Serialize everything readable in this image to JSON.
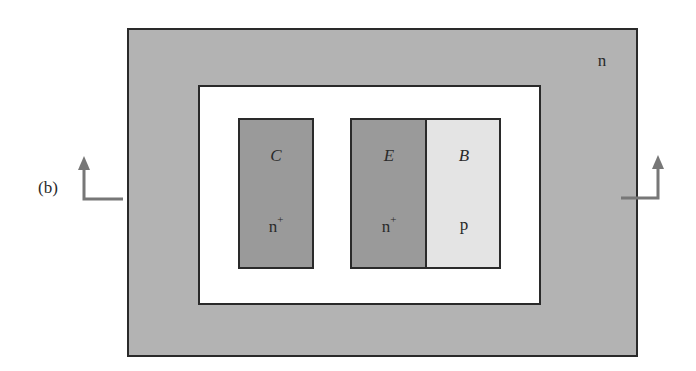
{
  "figure": {
    "panel_label": "(b)",
    "substrate": {
      "label": "n",
      "color": "#b3b3b3"
    },
    "well": {
      "color": "#ffffff"
    },
    "regions": [
      {
        "id": "collector",
        "terminal": "C",
        "doping": "n",
        "doping_sup": "+",
        "color": "#9a9a9a"
      },
      {
        "id": "emitter",
        "terminal": "E",
        "doping": "n",
        "doping_sup": "+",
        "color": "#9a9a9a"
      },
      {
        "id": "base",
        "terminal": "B",
        "doping": "p",
        "doping_sup": "",
        "color": "#e4e4e4"
      }
    ],
    "section_arrows": {
      "color": "#777777",
      "count": 2
    }
  }
}
